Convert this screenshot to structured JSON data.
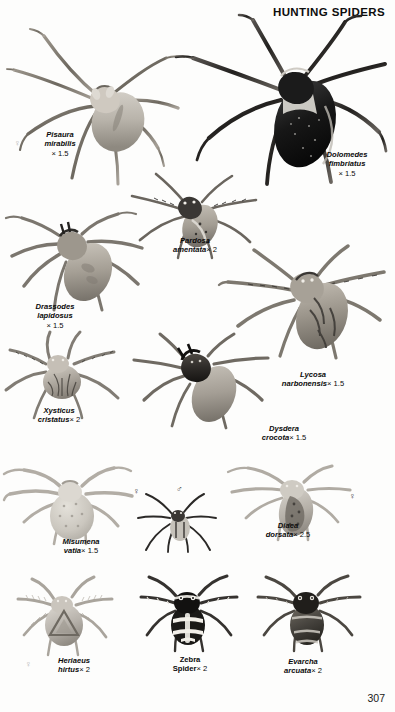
{
  "page": {
    "header_title": "HUNTING SPIDERS",
    "page_number": "307",
    "background_color": "#fdfdfc",
    "ink_color": "#0a0a0a"
  },
  "symbols": {
    "female": "♀",
    "male": "♂"
  },
  "figures": [
    {
      "id": "pisaura-mirabilis",
      "species_line1": "Pisaura",
      "species_line2": "mirabilis",
      "magnification": "× 1.5",
      "sex": "♀",
      "name_style": "scientific"
    },
    {
      "id": "dolomedes-fimbriatus",
      "species_line1": "Dolomedes",
      "species_line2": "fimbriatus",
      "magnification": "× 1.5",
      "sex": "",
      "name_style": "scientific"
    },
    {
      "id": "pardosa-amentata",
      "species_line1": "Pardosa",
      "species_line2": "amentata",
      "magnification": "× 2",
      "sex": "",
      "name_style": "scientific"
    },
    {
      "id": "drassodes-lapidosus",
      "species_line1": "Drassodes",
      "species_line2": "lapidosus",
      "magnification": "× 1.5",
      "sex": "",
      "name_style": "scientific"
    },
    {
      "id": "lycosa-narbonensis",
      "species_line1": "Lycosa",
      "species_line2": "narbonensis",
      "magnification": "× 1.5",
      "sex": "",
      "name_style": "scientific"
    },
    {
      "id": "xysticus-cristatus",
      "species_line1": "Xysticus",
      "species_line2": "cristatus",
      "magnification": "× 2",
      "sex": "",
      "name_style": "scientific"
    },
    {
      "id": "dysdera-crocota",
      "species_line1": "Dysdera",
      "species_line2": "crocota",
      "magnification": "× 1.5",
      "sex": "",
      "name_style": "scientific"
    },
    {
      "id": "misumena-vatia",
      "species_line1": "Misumena",
      "species_line2": "vatia",
      "magnification": "× 1.5",
      "sex": "♀",
      "sex_secondary": "♂",
      "name_style": "scientific"
    },
    {
      "id": "diaea-dorsata",
      "species_line1": "Diaea",
      "species_line2": "dorsata",
      "magnification": "× 2.5",
      "sex": "♀",
      "name_style": "scientific"
    },
    {
      "id": "heriaeus-hirtus",
      "species_line1": "Heriaeus",
      "species_line2": "hirtus",
      "magnification": "× 2",
      "sex": "♀",
      "name_style": "scientific"
    },
    {
      "id": "zebra-spider",
      "species_line1": "Zebra",
      "species_line2": "Spider",
      "magnification": "× 2",
      "sex": "",
      "name_style": "common"
    },
    {
      "id": "evarcha-arcuata",
      "species_line1": "Evarcha",
      "species_line2": "arcuata",
      "magnification": "× 2",
      "sex": "",
      "name_style": "scientific"
    }
  ]
}
